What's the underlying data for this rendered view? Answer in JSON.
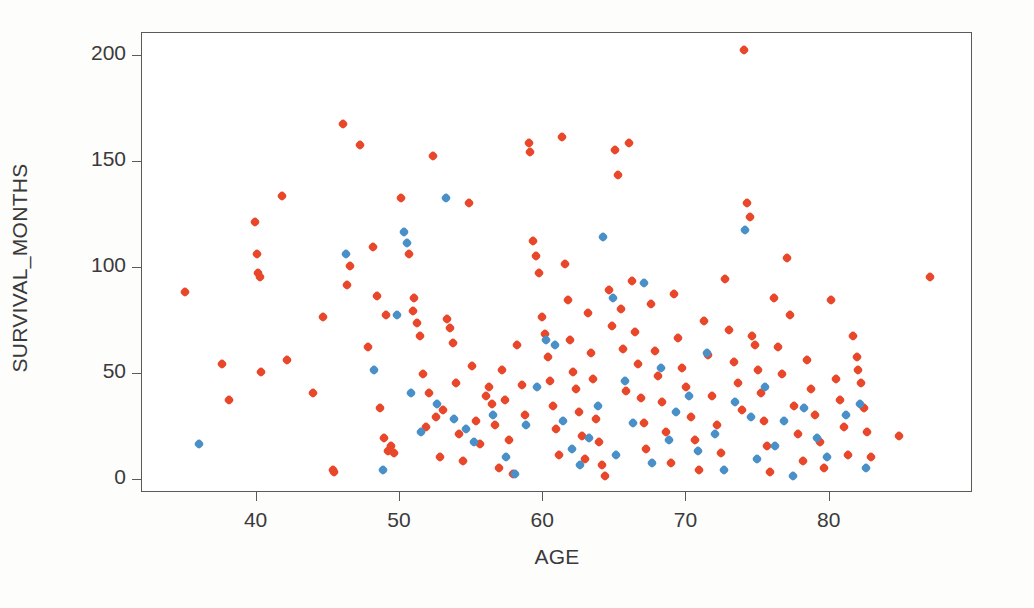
{
  "chart_data": {
    "type": "scatter",
    "title": "",
    "xlabel": "AGE",
    "ylabel": "SURVIVAL_MONTHS",
    "xlim": [
      32.0,
      90.0
    ],
    "ylim": [
      -6.0,
      211.0
    ],
    "xticks": [
      40,
      50,
      60,
      70,
      80
    ],
    "yticks": [
      0,
      50,
      100,
      150,
      200
    ],
    "grid": false,
    "legend": "none",
    "marker": "small-diamond",
    "marker_size_px": 8,
    "series": [
      {
        "name": "series-1",
        "color": "#e8472a",
        "points": [
          [
            35.0,
            89
          ],
          [
            37.6,
            55
          ],
          [
            38.1,
            38
          ],
          [
            39.9,
            122
          ],
          [
            40.0,
            107
          ],
          [
            40.1,
            98
          ],
          [
            40.2,
            96
          ],
          [
            40.3,
            51
          ],
          [
            41.8,
            134
          ],
          [
            42.1,
            57
          ],
          [
            43.9,
            41
          ],
          [
            44.6,
            77
          ],
          [
            45.3,
            5
          ],
          [
            45.4,
            4
          ],
          [
            46.0,
            168
          ],
          [
            46.3,
            92
          ],
          [
            46.5,
            101
          ],
          [
            47.2,
            158
          ],
          [
            47.8,
            63
          ],
          [
            48.1,
            110
          ],
          [
            48.4,
            87
          ],
          [
            48.6,
            34
          ],
          [
            48.9,
            20
          ],
          [
            49.0,
            78
          ],
          [
            49.2,
            14
          ],
          [
            49.4,
            16
          ],
          [
            49.6,
            13
          ],
          [
            50.1,
            133
          ],
          [
            50.6,
            107
          ],
          [
            50.9,
            80
          ],
          [
            51.0,
            86
          ],
          [
            51.2,
            74
          ],
          [
            51.4,
            68
          ],
          [
            51.6,
            50
          ],
          [
            51.8,
            25
          ],
          [
            52.0,
            41
          ],
          [
            52.3,
            153
          ],
          [
            52.5,
            30
          ],
          [
            52.8,
            11
          ],
          [
            53.0,
            33
          ],
          [
            53.3,
            76
          ],
          [
            53.5,
            72
          ],
          [
            53.7,
            65
          ],
          [
            53.9,
            46
          ],
          [
            54.1,
            22
          ],
          [
            54.4,
            9
          ],
          [
            54.8,
            131
          ],
          [
            55.0,
            54
          ],
          [
            55.3,
            28
          ],
          [
            55.6,
            17
          ],
          [
            56.0,
            40
          ],
          [
            56.2,
            44
          ],
          [
            56.4,
            36
          ],
          [
            56.6,
            26
          ],
          [
            56.9,
            6
          ],
          [
            57.1,
            52
          ],
          [
            57.3,
            38
          ],
          [
            57.6,
            19
          ],
          [
            57.9,
            3
          ],
          [
            58.2,
            64
          ],
          [
            58.5,
            45
          ],
          [
            58.7,
            31
          ],
          [
            59.0,
            159
          ],
          [
            59.1,
            155
          ],
          [
            59.3,
            113
          ],
          [
            59.5,
            106
          ],
          [
            59.7,
            98
          ],
          [
            59.9,
            77
          ],
          [
            60.1,
            69
          ],
          [
            60.3,
            58
          ],
          [
            60.5,
            47
          ],
          [
            60.7,
            35
          ],
          [
            60.9,
            24
          ],
          [
            61.1,
            12
          ],
          [
            61.3,
            162
          ],
          [
            61.5,
            102
          ],
          [
            61.7,
            85
          ],
          [
            61.9,
            66
          ],
          [
            62.1,
            51
          ],
          [
            62.3,
            43
          ],
          [
            62.5,
            32
          ],
          [
            62.7,
            21
          ],
          [
            62.9,
            10
          ],
          [
            63.1,
            79
          ],
          [
            63.3,
            60
          ],
          [
            63.5,
            48
          ],
          [
            63.7,
            29
          ],
          [
            63.9,
            18
          ],
          [
            64.1,
            7
          ],
          [
            64.3,
            2
          ],
          [
            64.6,
            90
          ],
          [
            64.8,
            73
          ],
          [
            65.0,
            156
          ],
          [
            65.2,
            144
          ],
          [
            65.4,
            81
          ],
          [
            65.6,
            62
          ],
          [
            65.8,
            42
          ],
          [
            66.0,
            159
          ],
          [
            66.2,
            94
          ],
          [
            66.4,
            70
          ],
          [
            66.6,
            55
          ],
          [
            66.8,
            39
          ],
          [
            67.0,
            27
          ],
          [
            67.2,
            15
          ],
          [
            67.5,
            83
          ],
          [
            67.8,
            61
          ],
          [
            68.0,
            49
          ],
          [
            68.3,
            37
          ],
          [
            68.6,
            23
          ],
          [
            68.9,
            8
          ],
          [
            69.1,
            88
          ],
          [
            69.4,
            67
          ],
          [
            69.7,
            53
          ],
          [
            70.0,
            44
          ],
          [
            70.3,
            30
          ],
          [
            70.6,
            19
          ],
          [
            70.9,
            5
          ],
          [
            71.2,
            75
          ],
          [
            71.5,
            59
          ],
          [
            71.8,
            40
          ],
          [
            72.1,
            26
          ],
          [
            72.4,
            13
          ],
          [
            72.7,
            95
          ],
          [
            73.0,
            71
          ],
          [
            73.3,
            56
          ],
          [
            73.6,
            46
          ],
          [
            73.9,
            33
          ],
          [
            74.0,
            203
          ],
          [
            74.2,
            131
          ],
          [
            74.4,
            124
          ],
          [
            74.6,
            68
          ],
          [
            74.8,
            64
          ],
          [
            75.0,
            52
          ],
          [
            75.2,
            41
          ],
          [
            75.4,
            28
          ],
          [
            75.6,
            16
          ],
          [
            75.8,
            4
          ],
          [
            76.1,
            86
          ],
          [
            76.4,
            63
          ],
          [
            76.7,
            50
          ],
          [
            77.0,
            105
          ],
          [
            77.2,
            78
          ],
          [
            77.5,
            35
          ],
          [
            77.8,
            22
          ],
          [
            78.1,
            9
          ],
          [
            78.4,
            57
          ],
          [
            78.7,
            43
          ],
          [
            79.0,
            31
          ],
          [
            79.3,
            18
          ],
          [
            79.6,
            6
          ],
          [
            80.1,
            85
          ],
          [
            80.4,
            48
          ],
          [
            80.7,
            38
          ],
          [
            81.0,
            25
          ],
          [
            81.3,
            12
          ],
          [
            81.6,
            68
          ],
          [
            81.9,
            58
          ],
          [
            82.0,
            52
          ],
          [
            82.2,
            46
          ],
          [
            82.4,
            34
          ],
          [
            82.6,
            23
          ],
          [
            82.9,
            11
          ],
          [
            84.8,
            21
          ],
          [
            87.0,
            96
          ]
        ]
      },
      {
        "name": "series-2",
        "color": "#4a90c8",
        "points": [
          [
            36.0,
            17
          ],
          [
            46.2,
            107
          ],
          [
            48.2,
            52
          ],
          [
            48.8,
            5
          ],
          [
            49.8,
            78
          ],
          [
            50.3,
            117
          ],
          [
            50.5,
            112
          ],
          [
            50.8,
            41
          ],
          [
            51.5,
            23
          ],
          [
            52.6,
            36
          ],
          [
            53.2,
            133
          ],
          [
            53.8,
            29
          ],
          [
            54.6,
            24
          ],
          [
            55.2,
            18
          ],
          [
            56.5,
            31
          ],
          [
            57.4,
            11
          ],
          [
            58.0,
            3
          ],
          [
            58.8,
            26
          ],
          [
            59.6,
            44
          ],
          [
            60.2,
            66
          ],
          [
            60.8,
            64
          ],
          [
            61.4,
            28
          ],
          [
            62.0,
            15
          ],
          [
            62.6,
            7
          ],
          [
            63.2,
            20
          ],
          [
            63.8,
            35
          ],
          [
            64.2,
            115
          ],
          [
            64.9,
            86
          ],
          [
            65.1,
            12
          ],
          [
            65.7,
            47
          ],
          [
            66.3,
            27
          ],
          [
            67.0,
            93
          ],
          [
            67.6,
            8
          ],
          [
            68.2,
            53
          ],
          [
            68.8,
            19
          ],
          [
            69.3,
            32
          ],
          [
            70.2,
            40
          ],
          [
            70.8,
            14
          ],
          [
            71.4,
            60
          ],
          [
            72.0,
            22
          ],
          [
            72.6,
            5
          ],
          [
            73.4,
            37
          ],
          [
            74.1,
            118
          ],
          [
            74.5,
            30
          ],
          [
            74.9,
            10
          ],
          [
            75.5,
            44
          ],
          [
            76.2,
            16
          ],
          [
            76.8,
            28
          ],
          [
            77.4,
            2
          ],
          [
            78.2,
            34
          ],
          [
            79.1,
            20
          ],
          [
            79.8,
            11
          ],
          [
            81.1,
            31
          ],
          [
            82.1,
            36
          ],
          [
            82.5,
            6
          ]
        ]
      }
    ]
  },
  "axes": {
    "x_ticks": [
      "40",
      "50",
      "60",
      "70",
      "80"
    ],
    "y_ticks": [
      "200",
      "150",
      "100",
      "50",
      "0"
    ],
    "x_label": "AGE",
    "y_label": "SURVIVAL_MONTHS"
  },
  "colors": {
    "series_1": "#e8472a",
    "series_2": "#4a90c8",
    "axis": "#5a5a5a",
    "text": "#3a3a3a",
    "plot_background": "#ffffff",
    "page_background": "#fdfdfc"
  }
}
